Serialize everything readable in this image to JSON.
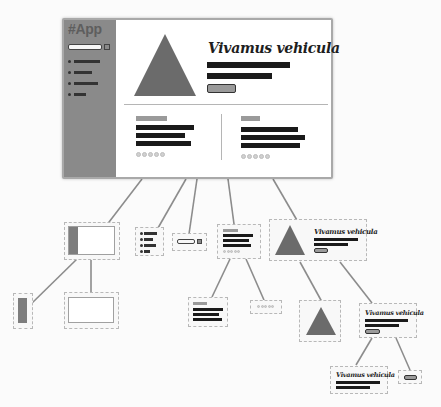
{
  "diagram": {
    "type": "component-tree",
    "root": {
      "label": "#App",
      "sidebar": {
        "title": "#App",
        "search_placeholder": "",
        "items": [
          {
            "bar_width": 26
          },
          {
            "bar_width": 18
          },
          {
            "bar_width": 24
          },
          {
            "bar_width": 12
          }
        ]
      },
      "hero": {
        "icon": "triangle-icon",
        "headline": "Vivamus vehicula",
        "text_lines": 2,
        "button_label": ""
      },
      "cards": [
        {
          "text_lines": 3,
          "rating_dots": 5
        },
        {
          "text_lines": 3,
          "rating_dots": 5
        }
      ]
    },
    "nodes": [
      {
        "id": "layout",
        "desc": "frame with sidebar",
        "children": [
          "sidebar-block",
          "content-block"
        ]
      },
      {
        "id": "sidebar-block",
        "desc": "sidebar"
      },
      {
        "id": "content-block",
        "desc": "content area"
      },
      {
        "id": "menu-list",
        "desc": "navigation list"
      },
      {
        "id": "search-box",
        "desc": "search input"
      },
      {
        "id": "card",
        "desc": "card",
        "children": [
          "card-text",
          "card-rating"
        ]
      },
      {
        "id": "card-text",
        "desc": "card text"
      },
      {
        "id": "card-rating",
        "desc": "rating dots"
      },
      {
        "id": "hero",
        "desc": "hero banner",
        "headline": "Vivamus vehicula",
        "children": [
          "hero-image",
          "hero-body"
        ]
      },
      {
        "id": "hero-image",
        "desc": "triangle image"
      },
      {
        "id": "hero-body",
        "desc": "hero text",
        "headline": "Vivamus vehicula",
        "children": [
          "hero-text",
          "hero-button"
        ]
      },
      {
        "id": "hero-text",
        "desc": "headline + lines",
        "headline": "Vivamus vehicula"
      },
      {
        "id": "hero-button",
        "desc": "button"
      }
    ]
  },
  "colors": {
    "sidebar": "#8a8a8a",
    "triangle": "#6b6b6b",
    "text_bar": "#1a1a1a",
    "dashed_border": "#b8b8b8",
    "connector": "#8c8c8c",
    "background": "#fbfbfb"
  }
}
